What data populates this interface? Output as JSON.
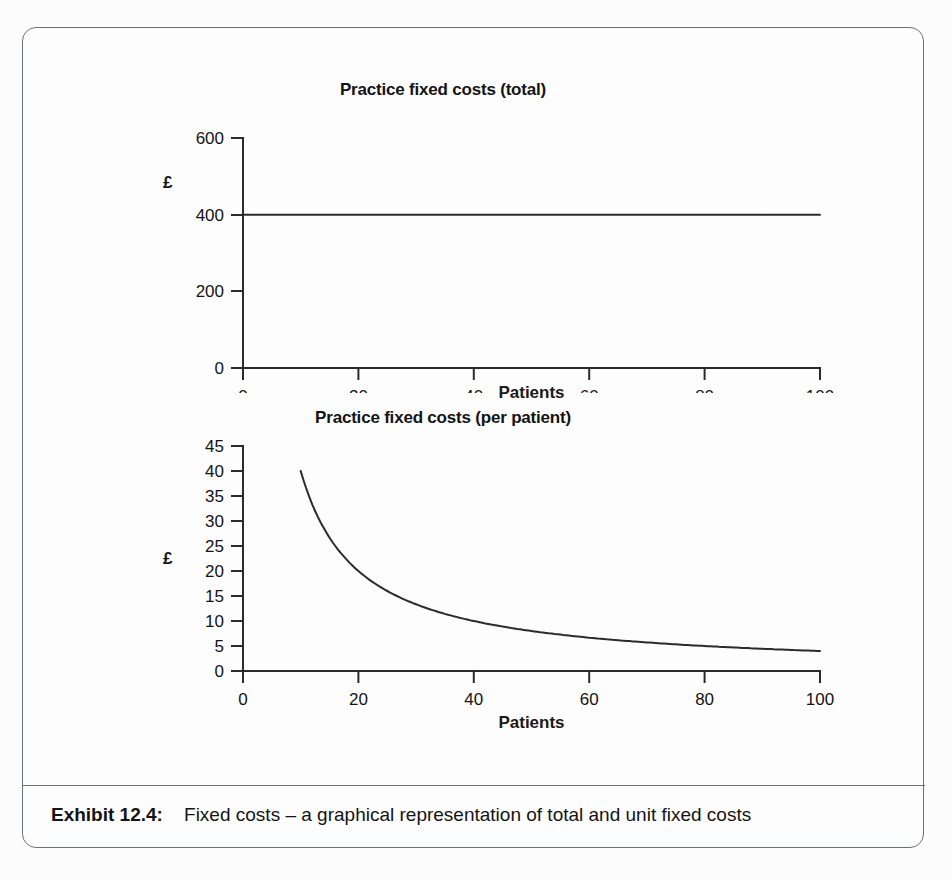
{
  "exhibit": {
    "caption_label": "Exhibit 12.4:",
    "caption_text": "Fixed costs – a graphical representation of total and unit fixed costs",
    "frame_color": "#6e7174",
    "ink_color": "#2b2b2b",
    "page_background": "#fcfcfc"
  },
  "chart_data": [
    {
      "type": "line",
      "id": "practice-fixed-costs-total",
      "title": "Practice fixed costs (total)",
      "xlabel": "Patients",
      "ylabel": "£",
      "xlim": [
        0,
        100
      ],
      "ylim": [
        0,
        600
      ],
      "xticks": [
        0,
        20,
        40,
        60,
        80,
        100
      ],
      "yticks": [
        0,
        200,
        400,
        600
      ],
      "xtick_labels": [
        "0",
        "20",
        "40",
        "60",
        "80",
        "100"
      ],
      "ytick_labels": [
        "0",
        "200",
        "400",
        "600"
      ],
      "grid": false,
      "legend": "none",
      "series": [
        {
          "name": "Total fixed costs",
          "x": [
            0,
            10,
            20,
            30,
            40,
            50,
            60,
            70,
            80,
            90,
            100
          ],
          "values": [
            400,
            400,
            400,
            400,
            400,
            400,
            400,
            400,
            400,
            400,
            400
          ]
        }
      ],
      "annotation": "Total fixed cost is constant at £400 regardless of patient numbers"
    },
    {
      "type": "line",
      "id": "practice-fixed-costs-per-patient",
      "title": "Practice fixed costs (per patient)",
      "xlabel": "Patients",
      "ylabel": "£",
      "xlim": [
        0,
        100
      ],
      "ylim": [
        0,
        45
      ],
      "xticks": [
        0,
        20,
        40,
        60,
        80,
        100
      ],
      "yticks": [
        0,
        5,
        10,
        15,
        20,
        25,
        30,
        35,
        40,
        45
      ],
      "xtick_labels": [
        "0",
        "20",
        "40",
        "60",
        "80",
        "100"
      ],
      "ytick_labels": [
        "0",
        "5",
        "10",
        "15",
        "20",
        "25",
        "30",
        "35",
        "40",
        "45"
      ],
      "grid": false,
      "legend": "none",
      "series": [
        {
          "name": "Fixed cost per patient",
          "x": [
            10,
            15,
            20,
            25,
            30,
            35,
            40,
            45,
            50,
            55,
            60,
            65,
            70,
            75,
            80,
            85,
            90,
            95,
            100
          ],
          "values": [
            40.0,
            26.7,
            20.0,
            16.0,
            13.3,
            11.4,
            10.0,
            8.9,
            8.0,
            7.3,
            6.7,
            6.2,
            5.7,
            5.3,
            5.0,
            4.7,
            4.4,
            4.2,
            4.0
          ]
        }
      ],
      "annotation": "Unit fixed cost falls hyperbolically as £400 is spread over more patients"
    }
  ]
}
